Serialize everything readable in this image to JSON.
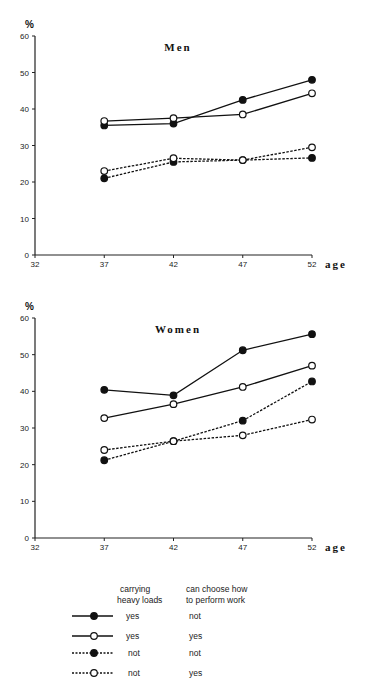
{
  "chart_data": [
    {
      "type": "line",
      "title": "Men",
      "xlabel": "age",
      "ylabel": "%",
      "x": [
        37,
        42,
        47,
        52
      ],
      "xticks": [
        32,
        37,
        42,
        47,
        52
      ],
      "yticks": [
        0,
        10,
        20,
        30,
        40,
        50,
        60
      ],
      "xlim": [
        32,
        52
      ],
      "ylim": [
        0,
        60
      ],
      "grid": false,
      "series": [
        {
          "name": "carrying heavy loads: yes / can choose how to perform work: not",
          "style": "solid-filled",
          "values": [
            35.5,
            36,
            42.5,
            48
          ]
        },
        {
          "name": "carrying heavy loads: yes / can choose how to perform work: yes",
          "style": "solid-open",
          "values": [
            36.7,
            37.5,
            38.5,
            44.3
          ]
        },
        {
          "name": "carrying heavy loads: not / can choose how to perform work: not",
          "style": "dashed-filled",
          "values": [
            21,
            25.5,
            26,
            26.6
          ]
        },
        {
          "name": "carrying heavy loads: not / can choose how to perform work: yes",
          "style": "dashed-open",
          "values": [
            23,
            26.5,
            26,
            29.5
          ]
        }
      ]
    },
    {
      "type": "line",
      "title": "Women",
      "xlabel": "age",
      "ylabel": "%",
      "x": [
        37,
        42,
        47,
        52
      ],
      "xticks": [
        32,
        37,
        42,
        47,
        52
      ],
      "yticks": [
        0,
        10,
        20,
        30,
        40,
        50,
        60
      ],
      "xlim": [
        32,
        52
      ],
      "ylim": [
        0,
        60
      ],
      "grid": false,
      "series": [
        {
          "name": "carrying heavy loads: yes / can choose how to perform work: not",
          "style": "solid-filled",
          "values": [
            40.4,
            38.9,
            51.2,
            55.6
          ]
        },
        {
          "name": "carrying heavy loads: yes / can choose how to perform work: yes",
          "style": "solid-open",
          "values": [
            32.7,
            36.5,
            41.2,
            47
          ]
        },
        {
          "name": "carrying heavy loads: not / can choose how to perform work: not",
          "style": "dashed-filled",
          "values": [
            21.2,
            26.4,
            32,
            42.7
          ]
        },
        {
          "name": "carrying heavy loads: not / can choose how to perform work: yes",
          "style": "dashed-open",
          "values": [
            24,
            26.4,
            28,
            32.3
          ]
        }
      ]
    }
  ],
  "legend": {
    "header_col1": [
      "carrying",
      "heavy loads"
    ],
    "header_col2": [
      "can choose how",
      "to perform work"
    ],
    "rows": [
      {
        "style": "solid-filled",
        "col1": "yes",
        "col2": "not"
      },
      {
        "style": "solid-open",
        "col1": "yes",
        "col2": "yes"
      },
      {
        "style": "dashed-filled",
        "col1": "not",
        "col2": "not"
      },
      {
        "style": "dashed-open",
        "col1": "not",
        "col2": "yes"
      }
    ]
  }
}
